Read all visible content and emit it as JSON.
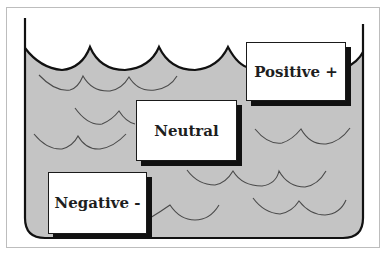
{
  "diagram": {
    "type": "water-level-container",
    "colors": {
      "water": "#c4c4c4",
      "outline": "#111111",
      "wave_lines": "#4a4a4a",
      "frame": "#bdbdbd",
      "background": "#ffffff",
      "label_box": "#ffffff",
      "label_shadow": "#111111"
    },
    "labels": [
      {
        "id": "positive",
        "text": "Positive +"
      },
      {
        "id": "neutral",
        "text": "Neutral"
      },
      {
        "id": "negative",
        "text": "Negative -"
      }
    ]
  }
}
